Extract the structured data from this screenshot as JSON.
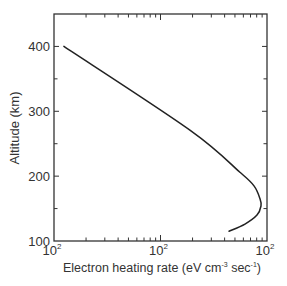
{
  "chart_data": {
    "type": "line",
    "title": "",
    "xlabel": "Electron heating rate (eV cm",
    "xlabel_sup1": "-3",
    "xlabel_mid": " sec",
    "xlabel_sup2": "-1",
    "xlabel_end": ")",
    "ylabel": "Altitude (km)",
    "xscale": "log",
    "xlim": [
      10,
      1000
    ],
    "ylim": [
      100,
      450
    ],
    "grid": false,
    "x_tick_labels": [
      {
        "value": 10,
        "base": "10",
        "exp": "2"
      },
      {
        "value": 100,
        "base": "10",
        "exp": "2"
      },
      {
        "value": 1000,
        "base": "10",
        "exp": "2"
      }
    ],
    "y_ticks": [
      100,
      200,
      300,
      400
    ],
    "y_tick_labels": [
      "100",
      "200",
      "300",
      "400"
    ],
    "series": [
      {
        "name": "Electron heating rate",
        "color": "#222222",
        "x": [
          12.4,
          189,
          557,
          755,
          860,
          879,
          806,
          621,
          440
        ],
        "y": [
          400,
          271,
          206,
          185,
          165,
          154,
          140,
          126,
          115
        ]
      }
    ]
  }
}
